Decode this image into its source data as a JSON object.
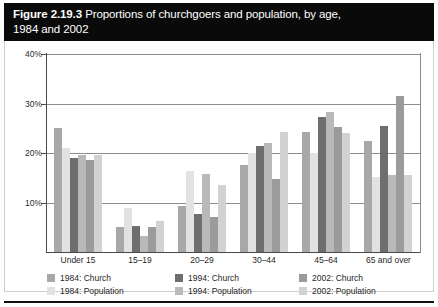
{
  "figure": {
    "label": "Figure 2.19.3",
    "title_rest": "Proportions of churchgoers and population, by age,",
    "title_line2": "1984 and 2002"
  },
  "axis": {
    "y_ticks": [
      "10%",
      "20%",
      "30%",
      "40%"
    ],
    "y_tick_values": [
      10,
      20,
      30,
      40
    ]
  },
  "legend": {
    "entries": [
      {
        "label": "1984: Church",
        "color": "#a8a8a8"
      },
      {
        "label": "1984: Population",
        "color": "#e2e2e2"
      },
      {
        "label": "1994: Church",
        "color": "#6e6e6e"
      },
      {
        "label": "1994: Population",
        "color": "#b9b9b9"
      },
      {
        "label": "2002: Church",
        "color": "#9b9b9b"
      },
      {
        "label": "2002: Population",
        "color": "#d2d2d2"
      }
    ]
  },
  "chart_data": {
    "type": "bar",
    "title": "Proportions of churchgoers and population, by age, 1984 and 2002",
    "xlabel": "",
    "ylabel": "",
    "ylim": [
      0,
      40
    ],
    "yticks": [
      10,
      20,
      30,
      40
    ],
    "ytick_labels": [
      "10%",
      "20%",
      "30%",
      "40%"
    ],
    "grid": true,
    "legend_position": "bottom",
    "categories": [
      "Under 15",
      "15–19",
      "20–29",
      "30–44",
      "45–64",
      "65 and over"
    ],
    "series": [
      {
        "name": "1984: Church",
        "color": "#a8a8a8",
        "values": [
          25.0,
          5.0,
          9.2,
          17.5,
          24.2,
          22.5
        ]
      },
      {
        "name": "1984: Population",
        "color": "#e2e2e2",
        "values": [
          21.0,
          8.8,
          16.3,
          20.0,
          20.0,
          15.2
        ]
      },
      {
        "name": "1994: Church",
        "color": "#6e6e6e",
        "values": [
          19.0,
          5.2,
          7.7,
          21.5,
          27.3,
          25.5
        ]
      },
      {
        "name": "1994: Population",
        "color": "#b9b9b9",
        "values": [
          19.5,
          3.2,
          15.8,
          22.0,
          28.3,
          15.5
        ]
      },
      {
        "name": "2002: Church",
        "color": "#9b9b9b",
        "values": [
          18.5,
          5.0,
          7.0,
          14.8,
          25.3,
          31.5
        ]
      },
      {
        "name": "2002: Population",
        "color": "#d2d2d2",
        "values": [
          19.5,
          6.3,
          13.5,
          24.2,
          24.0,
          15.5
        ]
      }
    ]
  }
}
